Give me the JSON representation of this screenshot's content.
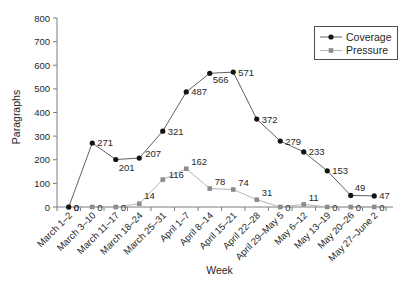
{
  "chart_data": {
    "type": "line",
    "title": "",
    "xlabel": "Week",
    "ylabel": "Paragraphs",
    "ylim": [
      0,
      800
    ],
    "ytick_interval": 100,
    "grid": false,
    "data_labels": true,
    "legend": {
      "position": "top-right"
    },
    "categories": [
      "March 1–2",
      "March 3–10",
      "March 11–17",
      "March 18–24",
      "March 25–31",
      "April 1–7",
      "April 8–14",
      "April 15–21",
      "April 22–28",
      "April 29–May 5",
      "May 6–12",
      "May 13–19",
      "May 20–26",
      "May 27–June 2"
    ],
    "series": [
      {
        "name": "Coverage",
        "marker": "circle",
        "marker_color": "#141414",
        "line_color": "#606060",
        "values": [
          0,
          271,
          201,
          207,
          321,
          487,
          566,
          571,
          372,
          279,
          233,
          153,
          49,
          47
        ]
      },
      {
        "name": "Pressure",
        "marker": "square",
        "marker_color": "#8c8c8c",
        "line_color": "#b5b5b5",
        "values": [
          0,
          0,
          0,
          14,
          116,
          162,
          78,
          74,
          31,
          0,
          11,
          0,
          0,
          0
        ]
      }
    ]
  },
  "colors": {
    "background": "#ffffff",
    "axis": "#7f7f7f",
    "text": "#1f1f1f",
    "legend_border": "#4d4d4d"
  }
}
